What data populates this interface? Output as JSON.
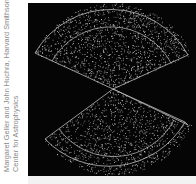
{
  "image": {
    "description": "CfA redshift survey slice map: two fan-shaped wedges of galaxy points meeting at a central apex on a black background",
    "credit_lines": [
      "Margaret Geller and John Huchra, Harvard Smithsonian",
      "Center for Astrophysics"
    ],
    "colors": {
      "background": "#050505",
      "outline": "#bdbdbd",
      "points": "#d8d8d8",
      "credit_text": "#8a8a8a"
    }
  }
}
